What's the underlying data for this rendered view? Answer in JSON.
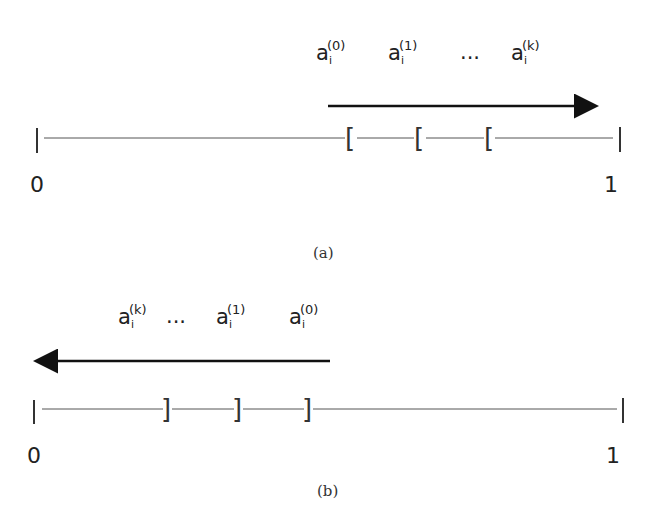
{
  "panel_a": {
    "labels": [
      {
        "base": "a",
        "sub": "i",
        "sup": "(0)"
      },
      {
        "base": "a",
        "sub": "i",
        "sup": "(1)"
      },
      {
        "ellipsis": "..."
      },
      {
        "base": "a",
        "sub": "i",
        "sup": "(k)"
      }
    ],
    "arrow_direction": "right",
    "bracket": "[",
    "start_label": "0",
    "end_label": "1",
    "caption": "(a)"
  },
  "panel_b": {
    "labels": [
      {
        "base": "a",
        "sub": "i",
        "sup": "(k)"
      },
      {
        "ellipsis": "..."
      },
      {
        "base": "a",
        "sub": "i",
        "sup": "(1)"
      },
      {
        "base": "a",
        "sub": "i",
        "sup": "(0)"
      }
    ],
    "arrow_direction": "left",
    "bracket": "]",
    "start_label": "0",
    "end_label": "1",
    "caption": "(b)"
  }
}
